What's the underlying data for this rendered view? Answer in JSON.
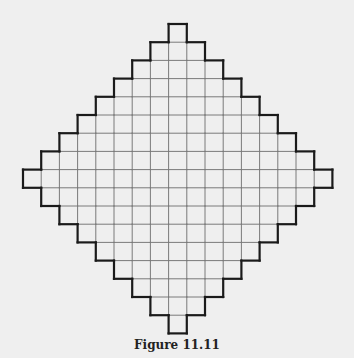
{
  "figure": {
    "caption": "Figure 11.11",
    "shape": "diamond-shaped polyomino (Aztec-diamond-like staircase) on a square grid",
    "grid": {
      "rows": 17,
      "columns": 17,
      "row_cell_counts": [
        1,
        3,
        5,
        7,
        9,
        11,
        13,
        15,
        17,
        15,
        13,
        11,
        9,
        7,
        5,
        3,
        1
      ],
      "cell_size_px": 18.2,
      "origin_x": 23,
      "origin_y": 24
    },
    "colors": {
      "background": "#efefef",
      "outline": "#1a1a1a",
      "grid_lines": "#7a7a7a"
    }
  }
}
